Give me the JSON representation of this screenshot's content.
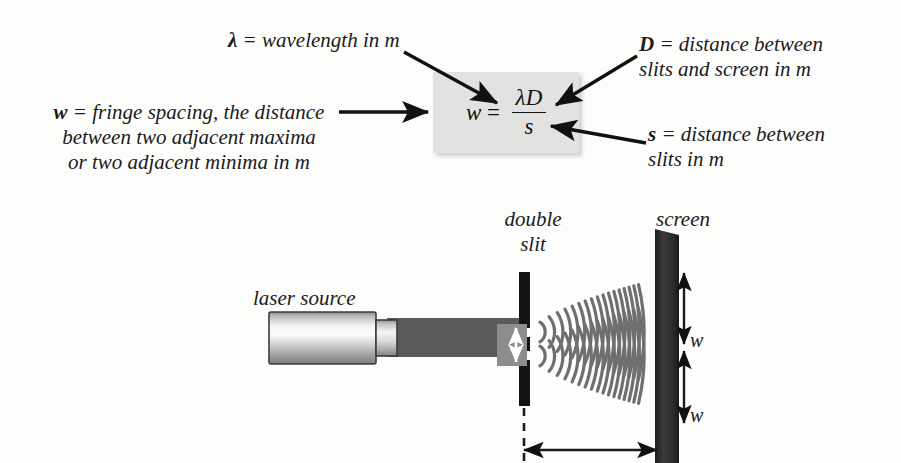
{
  "diagram": {
    "formula": {
      "lhs": "w",
      "equals": "=",
      "numerator": "λD",
      "denominator": "s",
      "full": "w = λD / s"
    },
    "annotations": {
      "lambda": {
        "symbol": "λ",
        "text": " = wavelength in m"
      },
      "w": {
        "symbol": "w",
        "text": " = fringe spacing, the distance\nbetween two adjacent maxima\nor two adjacent minima in m"
      },
      "D": {
        "symbol": "D",
        "text": " = distance between\nslits and screen in m"
      },
      "s": {
        "symbol": "s",
        "text": " = distance between\nslits in m"
      }
    },
    "apparatus": {
      "laser_source_label": "laser source",
      "double_slit_label": "double\nslit",
      "screen_label": "screen",
      "slit_separation_label": "s",
      "fringe_label_top": "w",
      "fringe_label_bottom": "w"
    },
    "colors": {
      "background": "#fdfdfc",
      "formula_box": "#e2e2e1",
      "beam": "#5a5a5a",
      "barrier": "#121212",
      "screen": "#2d2d2d",
      "wave_arc": "#6f6f6f",
      "text": "#1b1b1b",
      "arrow": "#111111",
      "laser_body_light": "#f2f2f2",
      "laser_body_dark": "#8a8a8a"
    }
  }
}
